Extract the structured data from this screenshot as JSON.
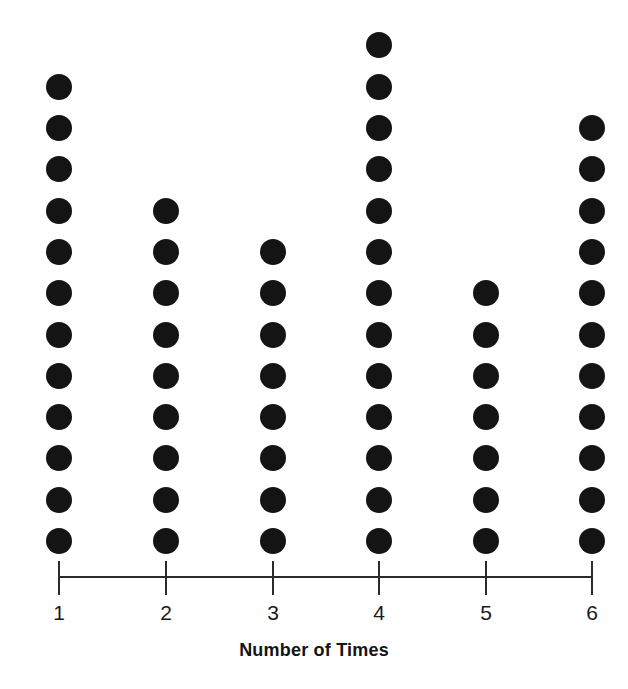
{
  "chart_data": {
    "type": "scatter",
    "plot_style": "dot-plot",
    "title": "",
    "xlabel": "Number of Times",
    "ylabel": "",
    "categories": [
      "1",
      "2",
      "3",
      "4",
      "5",
      "6"
    ],
    "values": [
      12,
      9,
      8,
      13,
      7,
      11
    ],
    "series": [
      {
        "name": "Frequency",
        "values": [
          12,
          9,
          8,
          13,
          7,
          11
        ]
      }
    ],
    "tick_labels": [
      "1",
      "2",
      "3",
      "4",
      "5",
      "6"
    ],
    "xlim": [
      1,
      6
    ],
    "ylim": [
      0,
      13
    ],
    "grid": false,
    "legend": "none",
    "dot_color": "#141414",
    "axis_color": "#2b2b2b",
    "background_color": "#ffffff",
    "total_dots": 60,
    "annotations": []
  },
  "axis": {
    "title": "Number of Times"
  }
}
